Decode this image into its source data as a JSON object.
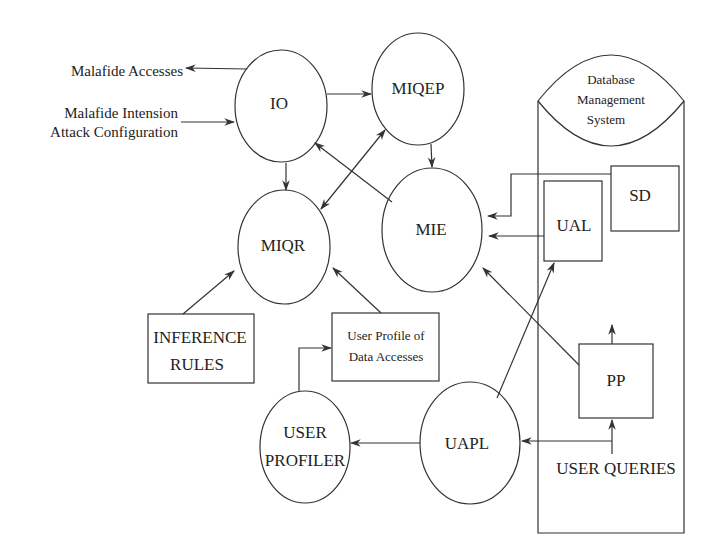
{
  "diagram": {
    "type": "flow",
    "nodes": {
      "io": {
        "label": "IO",
        "shape": "ellipse"
      },
      "miqep": {
        "label": "MIQEP",
        "shape": "ellipse"
      },
      "mie": {
        "label": "MIE",
        "shape": "ellipse"
      },
      "miqr": {
        "label": "MIQR",
        "shape": "ellipse"
      },
      "dbms": {
        "label_lines": [
          "Database",
          "Management",
          "System"
        ],
        "shape": "cylinder"
      },
      "sd": {
        "label": "SD",
        "shape": "rect"
      },
      "ual": {
        "label": "UAL",
        "shape": "rect"
      },
      "inference_rules": {
        "label_lines": [
          "INFERENCE",
          "RULES"
        ],
        "shape": "rect"
      },
      "user_profile": {
        "label_lines": [
          "User Profile of",
          "Data Accesses"
        ],
        "shape": "rect"
      },
      "user_profiler": {
        "label_lines": [
          "USER",
          "PROFILER"
        ],
        "shape": "ellipse"
      },
      "uapl": {
        "label": "UAPL",
        "shape": "ellipse"
      },
      "pp": {
        "label": "PP",
        "shape": "rect"
      }
    },
    "external_labels": {
      "malafide_accesses": "Malafide Accesses",
      "malafide_intension_line1": "Malafide Intension",
      "malafide_intension_line2": "Attack Configuration",
      "user_queries": "USER QUERIES"
    },
    "edges": [
      {
        "from": "io",
        "to": "Malafide Accesses"
      },
      {
        "from": "Malafide Intension Attack Configuration",
        "to": "io"
      },
      {
        "from": "io",
        "to": "miqep"
      },
      {
        "from": "io",
        "to": "miqr"
      },
      {
        "from": "miqep",
        "to": "mie"
      },
      {
        "from": "miqr",
        "to": "miqep",
        "bidirectional": true
      },
      {
        "from": "mie",
        "to": "io"
      },
      {
        "from": "sd",
        "to": "mie"
      },
      {
        "from": "ual",
        "to": "mie"
      },
      {
        "from": "inference_rules",
        "to": "miqr"
      },
      {
        "from": "user_profile",
        "to": "miqr"
      },
      {
        "from": "user_profiler",
        "to": "user_profile"
      },
      {
        "from": "uapl",
        "to": "user_profiler"
      },
      {
        "from": "uapl",
        "to": "ual"
      },
      {
        "from": "pp",
        "to": "mie"
      },
      {
        "from": "pp",
        "to": "dbms"
      },
      {
        "from": "user_queries",
        "to": "pp"
      },
      {
        "from": "user_queries",
        "to": "uapl"
      }
    ]
  }
}
